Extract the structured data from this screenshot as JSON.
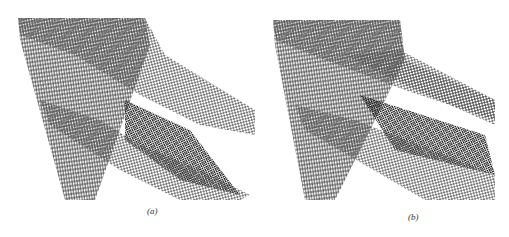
{
  "figure": {
    "panels": [
      {
        "id": "a",
        "caption": "(a)",
        "description": "Wireframe mesh of a column with a tapered/curved joint bracket"
      },
      {
        "id": "b",
        "caption": "(b)",
        "description": "Wireframe mesh of a column with a straight rectangular beam joint"
      }
    ],
    "colors": {
      "mesh_line": "#555555",
      "background": "#ffffff",
      "dense_mesh": "#3a3a3a"
    }
  }
}
